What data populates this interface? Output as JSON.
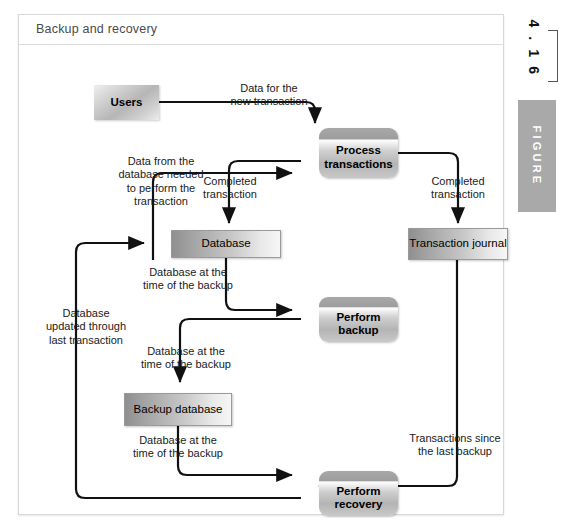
{
  "figure": {
    "panel_title": "Backup and recovery",
    "marker_word": "FIGURE",
    "marker_number": "4 . 1 6"
  },
  "diagram": {
    "type": "flowchart",
    "nodes": [
      {
        "id": "users",
        "label": "Users",
        "shape": "actor"
      },
      {
        "id": "process-transactions",
        "label": "Process\ntransactions",
        "shape": "process"
      },
      {
        "id": "database",
        "label": "Database",
        "shape": "datastore"
      },
      {
        "id": "transaction-journal",
        "label": "Transaction\njournal",
        "shape": "datastore"
      },
      {
        "id": "perform-backup",
        "label": "Perform\nbackup",
        "shape": "process"
      },
      {
        "id": "backup-database",
        "label": "Backup\ndatabase",
        "shape": "datastore"
      },
      {
        "id": "perform-recovery",
        "label": "Perform\nrecovery",
        "shape": "process"
      }
    ],
    "edges": [
      {
        "id": "e1",
        "from": "users",
        "to": "process-transactions",
        "label": "Data for the\nnew transaction"
      },
      {
        "id": "e2",
        "from": "database",
        "to": "process-transactions",
        "label": "Data from the\ndatabase needed\nto perform the\ntransaction"
      },
      {
        "id": "e3",
        "from": "process-transactions",
        "to": "database",
        "label": "Completed\ntransaction"
      },
      {
        "id": "e4",
        "from": "process-transactions",
        "to": "transaction-journal",
        "label": "Completed\ntransaction"
      },
      {
        "id": "e5",
        "from": "database",
        "to": "perform-backup",
        "label": "Database at the\ntime of the backup"
      },
      {
        "id": "e6",
        "from": "perform-backup",
        "to": "backup-database",
        "label": "Database at the\ntime of the backup"
      },
      {
        "id": "e7",
        "from": "backup-database",
        "to": "perform-recovery",
        "label": "Database at the\ntime of the backup"
      },
      {
        "id": "e8",
        "from": "transaction-journal",
        "to": "perform-recovery",
        "label": "Transactions since\nthe last backup"
      },
      {
        "id": "e9",
        "from": "perform-recovery",
        "to": "database",
        "label": "Database\nupdated through\nlast transaction"
      }
    ]
  },
  "colors": {
    "node_gray": "#b4b4b4",
    "marker_gray": "#a9a9a9",
    "line_black": "#111111",
    "panel_border": "#d8d8d8",
    "title_text": "#4a4a4a"
  }
}
